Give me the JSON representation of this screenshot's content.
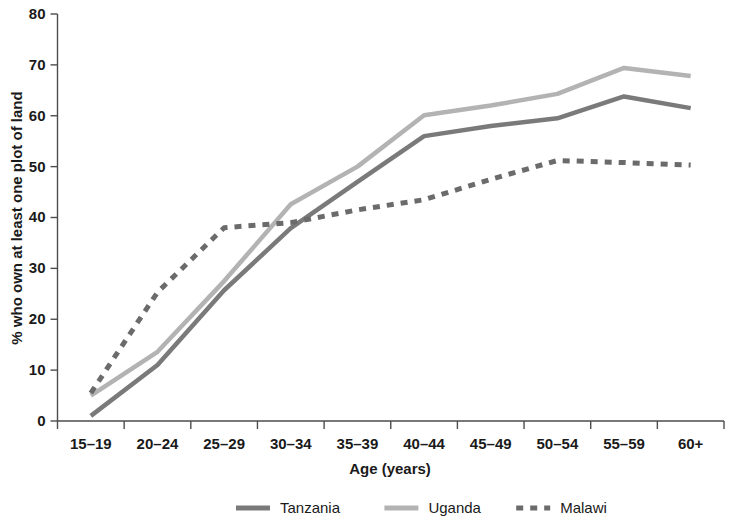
{
  "chart_data": {
    "type": "line",
    "title": "",
    "xlabel": "Age (years)",
    "ylabel": "% who own at least one plot of land",
    "categories": [
      "15–19",
      "20–24",
      "25–29",
      "30–34",
      "35–39",
      "40–44",
      "45–49",
      "50–54",
      "55–59",
      "60+"
    ],
    "ylim": [
      0,
      80
    ],
    "yticks": [
      0,
      10,
      20,
      30,
      40,
      50,
      60,
      70,
      80
    ],
    "ytick_labels": [
      "0",
      "10",
      "20",
      "30",
      "40",
      "50",
      "60",
      "70",
      "80"
    ],
    "grid": false,
    "legend_position": "bottom",
    "series": [
      {
        "name": "Tanzania",
        "style": "solid",
        "color": "#7a7a7a",
        "values": [
          1.0,
          11.0,
          25.7,
          37.9,
          47.0,
          56.0,
          58.0,
          59.5,
          63.8,
          61.5
        ]
      },
      {
        "name": "Uganda",
        "style": "solid",
        "color": "#b3b3b3",
        "values": [
          5.0,
          13.6,
          27.5,
          42.6,
          50.0,
          60.1,
          62.0,
          64.3,
          69.4,
          67.8
        ]
      },
      {
        "name": "Malawi",
        "style": "dashed",
        "color": "#6b6b6b",
        "values": [
          5.5,
          25.3,
          38.0,
          39.0,
          41.5,
          43.5,
          47.5,
          51.2,
          50.8,
          50.3
        ]
      }
    ]
  },
  "legend": {
    "items": [
      {
        "label": "Tanzania",
        "swatch": "solid-line-swatch"
      },
      {
        "label": "Uganda",
        "swatch": "solid-line-swatch"
      },
      {
        "label": "Malawi",
        "swatch": "dashed-line-swatch"
      }
    ]
  }
}
